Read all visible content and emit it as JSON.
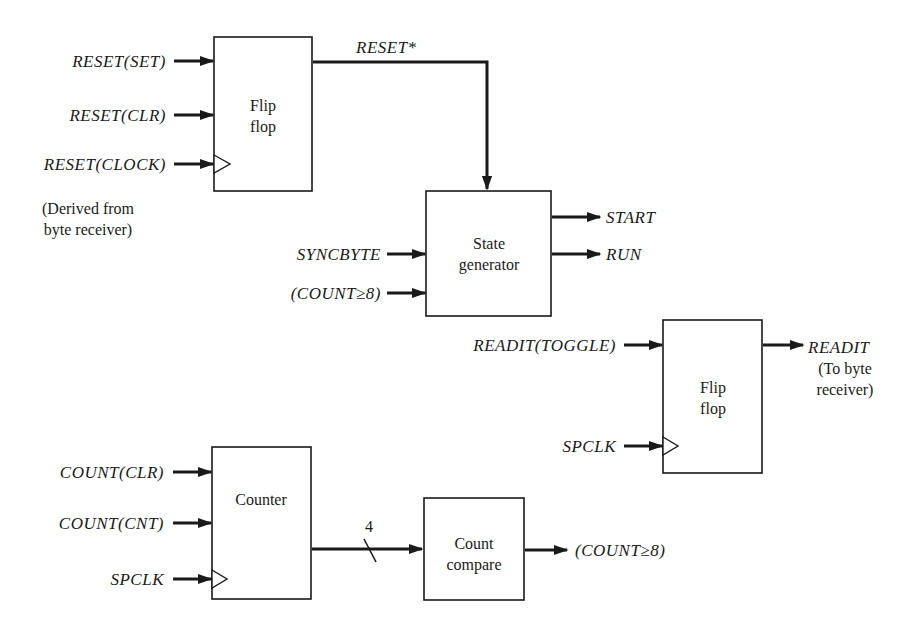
{
  "diagram": {
    "background": "#ffffff",
    "ink": "#1a1a1a",
    "blocks": {
      "reset_ff": {
        "lines": [
          "Flip",
          "flop"
        ]
      },
      "state_gen": {
        "lines": [
          "State",
          "generator"
        ]
      },
      "readit_ff": {
        "lines": [
          "Flip",
          "flop"
        ]
      },
      "counter": {
        "lines": [
          "Counter"
        ]
      },
      "count_compare": {
        "lines": [
          "Count",
          "compare"
        ]
      }
    },
    "signals": {
      "reset_set": "RESET(SET)",
      "reset_clr": "RESET(CLR)",
      "reset_clock": "RESET(CLOCK)",
      "reset_star": "RESET*",
      "syncbyte": "SYNCBYTE",
      "count_ge8_in": "(COUNT≥8)",
      "start": "START",
      "run": "RUN",
      "readit_toggle": "READIT(TOGGLE)",
      "readit": "READIT",
      "spclk_ff": "SPCLK",
      "count_clr": "COUNT(CLR)",
      "count_cnt": "COUNT(CNT)",
      "spclk_counter": "SPCLK",
      "count_ge8_out": "(COUNT≥8)"
    },
    "bus_width": "4",
    "notes": {
      "derived_line1": "(Derived from",
      "derived_line2": "byte receiver)",
      "readit_note_line1": "(To byte",
      "readit_note_line2": "receiver)"
    }
  }
}
